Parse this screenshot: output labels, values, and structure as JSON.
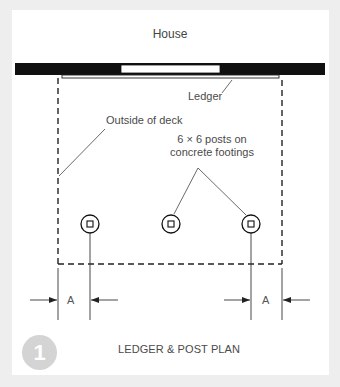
{
  "figure": {
    "title": "LEDGER & POST PLAN",
    "number": "1",
    "labels": {
      "house": "House",
      "ledger": "Ledger",
      "outside_of_deck": "Outside of deck",
      "posts_line1": "6 × 6 posts on",
      "posts_line2": "concrete footings",
      "dimension_left": "A",
      "dimension_right": "A"
    },
    "posts": [
      {
        "id": "post-left",
        "cx": 90,
        "cy": 224
      },
      {
        "id": "post-middle",
        "cx": 171,
        "cy": 224
      },
      {
        "id": "post-right",
        "cx": 251,
        "cy": 224
      }
    ],
    "colors": {
      "background": "#eeeeee",
      "panel": "#ffffff",
      "ink": "#111111",
      "text": "#4a4a4a",
      "badge": "#d4d4d4"
    }
  }
}
